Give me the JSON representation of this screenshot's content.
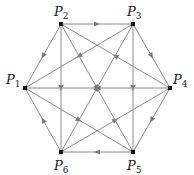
{
  "diagram": {
    "type": "directed-graph",
    "colors": {
      "edge": "#8a8a8a",
      "arrow": "#7a7a7a",
      "node": "#111111",
      "label": "#222222"
    },
    "nodes": [
      {
        "id": "P1",
        "label": "P",
        "sub": "1",
        "x": 25,
        "y": 88,
        "lx": 6,
        "ly": 84
      },
      {
        "id": "P2",
        "label": "P",
        "sub": "2",
        "x": 61,
        "y": 24,
        "lx": 54,
        "ly": 16
      },
      {
        "id": "P3",
        "label": "P",
        "sub": "3",
        "x": 133,
        "y": 24,
        "lx": 127,
        "ly": 16
      },
      {
        "id": "P4",
        "label": "P",
        "sub": "4",
        "x": 170,
        "y": 88,
        "lx": 173,
        "ly": 84
      },
      {
        "id": "P5",
        "label": "P",
        "sub": "5",
        "x": 133,
        "y": 152,
        "lx": 127,
        "ly": 170
      },
      {
        "id": "P6",
        "label": "P",
        "sub": "6",
        "x": 61,
        "y": 152,
        "lx": 54,
        "ly": 170
      }
    ],
    "edges": [
      {
        "from": "P2",
        "to": "P3"
      },
      {
        "from": "P3",
        "to": "P4"
      },
      {
        "from": "P4",
        "to": "P5"
      },
      {
        "from": "P5",
        "to": "P6"
      },
      {
        "from": "P6",
        "to": "P1"
      },
      {
        "from": "P2",
        "to": "P1"
      },
      {
        "from": "P2",
        "to": "P6"
      },
      {
        "from": "P3",
        "to": "P5"
      },
      {
        "from": "P4",
        "to": "P1"
      },
      {
        "from": "P4",
        "to": "P2"
      },
      {
        "from": "P3",
        "to": "P1"
      },
      {
        "from": "P6",
        "to": "P3"
      },
      {
        "from": "P6",
        "to": "P4"
      },
      {
        "from": "P2",
        "to": "P5"
      },
      {
        "from": "P1",
        "to": "P5"
      }
    ]
  }
}
